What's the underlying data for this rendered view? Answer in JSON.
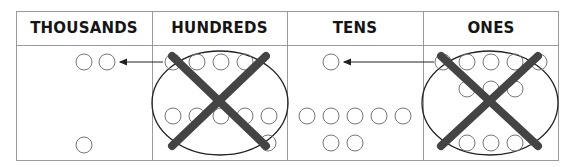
{
  "diagram": {
    "columns": [
      {
        "label": "THOUSANDS",
        "x": 16,
        "width": 136
      },
      {
        "label": "HUNDREDS",
        "x": 152,
        "width": 135
      },
      {
        "label": "TENS",
        "x": 287,
        "width": 136
      },
      {
        "label": "ONES",
        "x": 423,
        "width": 136
      }
    ],
    "colors": {
      "border": "#9a9a9a",
      "circle_stroke": "#777777",
      "ellipse_stroke": "#222222",
      "cross": "#444444",
      "arrow": "#222222",
      "header_text": "#151515"
    },
    "cells": {
      "thousands": {
        "circles": [
          [
            84,
            62
          ],
          [
            107,
            62
          ],
          [
            84,
            145
          ]
        ]
      },
      "hundreds": {
        "circles": [
          [
            173,
            62
          ],
          [
            197,
            62
          ],
          [
            221,
            62
          ],
          [
            245,
            62
          ],
          [
            173,
            116
          ],
          [
            197,
            116
          ],
          [
            221,
            116
          ],
          [
            245,
            116
          ],
          [
            269,
            116
          ],
          [
            268,
            143
          ]
        ],
        "group_ellipse": {
          "cx": 220,
          "cy": 103,
          "rx": 68,
          "ry": 52
        },
        "crossed_out": true,
        "cross": [
          [
            [
              172,
              56
            ],
            [
              266,
              146
            ]
          ],
          [
            [
              266,
              56
            ],
            [
              172,
              146
            ]
          ]
        ]
      },
      "tens": {
        "circles": [
          [
            331,
            62
          ],
          [
            307,
            116
          ],
          [
            331,
            116
          ],
          [
            355,
            116
          ],
          [
            379,
            116
          ],
          [
            403,
            116
          ],
          [
            331,
            143
          ],
          [
            355,
            143
          ]
        ]
      },
      "ones": {
        "circles": [
          [
            443,
            62
          ],
          [
            467,
            62
          ],
          [
            491,
            62
          ],
          [
            515,
            62
          ],
          [
            539,
            62
          ],
          [
            467,
            89
          ],
          [
            491,
            89
          ],
          [
            515,
            89
          ],
          [
            467,
            143
          ],
          [
            491,
            143
          ],
          [
            515,
            143
          ]
        ],
        "group_ellipse": {
          "cx": 490,
          "cy": 103,
          "rx": 68,
          "ry": 52
        },
        "crossed_out": true,
        "cross": [
          [
            [
              441,
              56
            ],
            [
              538,
              146
            ]
          ],
          [
            [
              538,
              56
            ],
            [
              441,
              146
            ]
          ]
        ]
      }
    },
    "arrows": [
      {
        "from": [
          163,
          62
        ],
        "to": [
          116,
          62
        ],
        "meaning": "regroup 10 hundreds into 1 thousand"
      },
      {
        "from": [
          434,
          62
        ],
        "to": [
          340,
          62
        ],
        "meaning": "regroup 10 ones into 1 ten"
      }
    ],
    "circle_radius": 8
  }
}
